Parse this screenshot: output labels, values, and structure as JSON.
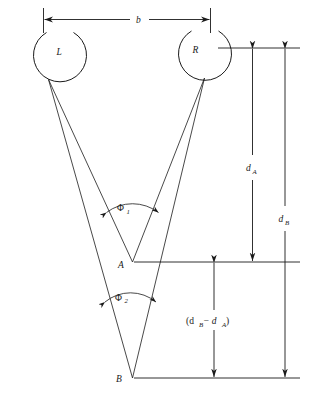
{
  "figure": {
    "nodes": [
      {
        "id": "L",
        "label": "L",
        "x": 60,
        "y": 52
      },
      {
        "id": "R",
        "label": "R",
        "x": 196,
        "y": 50
      },
      {
        "id": "A",
        "label": "A",
        "x": 122,
        "y": 268
      },
      {
        "id": "B",
        "label": "B",
        "x": 120,
        "y": 382
      }
    ],
    "dimensions": [
      {
        "id": "baseline",
        "label": "b",
        "x": 139,
        "y": 18,
        "orientation": "horizontal"
      },
      {
        "id": "dA",
        "label": "d",
        "subscript": "A",
        "x": 247,
        "y": 168,
        "orientation": "vertical"
      },
      {
        "id": "dB",
        "label": "d",
        "subscript": "B",
        "x": 279,
        "y": 219,
        "orientation": "vertical"
      },
      {
        "id": "dBminusdA",
        "label": "(d",
        "subscript": "B",
        "label2": " − d",
        "subscript2": "A",
        "label3": ")",
        "x": 186,
        "y": 324,
        "orientation": "vertical"
      }
    ],
    "angles": [
      {
        "id": "phi1",
        "symbol": "Φ",
        "subscript": "1",
        "x": 123,
        "y": 211
      },
      {
        "id": "phi2",
        "symbol": "Φ",
        "subscript": "2",
        "x": 120,
        "y": 300
      }
    ],
    "colors": {
      "ink": "#1a1a1a",
      "background": "#ffffff"
    }
  }
}
